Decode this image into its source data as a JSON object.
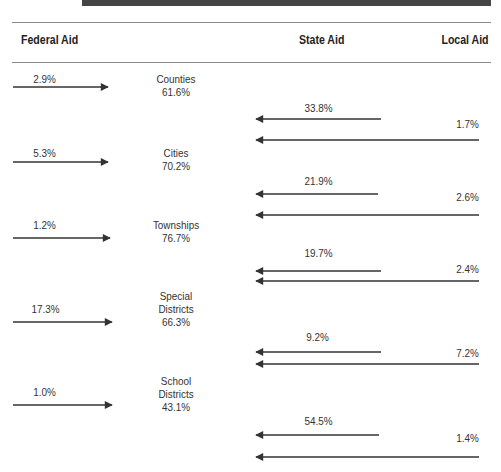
{
  "headers": {
    "federal": "Federal Aid",
    "state": "State Aid",
    "local": "Local Aid"
  },
  "groups": [
    {
      "entity_lines": [
        "Counties",
        "61.6%"
      ],
      "federal": "2.9%",
      "state": "33.8%",
      "local": "1.7%"
    },
    {
      "entity_lines": [
        "Cities",
        "70.2%"
      ],
      "federal": "5.3%",
      "state": "21.9%",
      "local": "2.6%"
    },
    {
      "entity_lines": [
        "Townships",
        "76.7%"
      ],
      "federal": "1.2%",
      "state": "19.7%",
      "local": "2.4%"
    },
    {
      "entity_lines": [
        "Special",
        "Districts",
        "66.3%"
      ],
      "federal": "17.3%",
      "state": "9.2%",
      "local": "7.2%"
    },
    {
      "entity_lines": [
        "School",
        "Districts",
        "43.1%"
      ],
      "federal": "1.0%",
      "state": "54.5%",
      "local": "1.4%"
    }
  ],
  "colors": {
    "arrow": "#333333",
    "rule": "#8a8a8a",
    "topbar": "#444444"
  }
}
